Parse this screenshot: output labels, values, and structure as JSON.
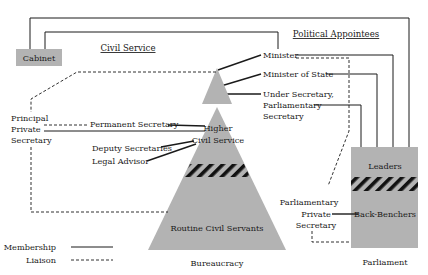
{
  "colors": {
    "shape_fill": "#b3b3b3",
    "line": "#1a1a1a",
    "background": "#ffffff"
  },
  "sections": {
    "civil_service": "Civil Service",
    "political_appointees": "Political Appointees"
  },
  "nodes": {
    "cabinet": "Cabinet",
    "minister": "Minister",
    "minister_of_state": "Minister of State",
    "under_secretary_1": "Under Secretary,",
    "under_secretary_2": "Parliamentary",
    "under_secretary_3": "Secretary",
    "principal_private_secretary_1": "Principal",
    "principal_private_secretary_2": "Private",
    "principal_private_secretary_3": "Secretary",
    "permanent_secretary": "Permanent Secretary",
    "higher_civil_service_1": "Higher",
    "higher_civil_service_2": "Civil Service",
    "deputy_secretaries": "Deputy Secretaries",
    "legal_advisor": "Legal Advisor",
    "routine_civil_servants": "Routine Civil Servants",
    "bureaucracy": "Bureaucracy",
    "leaders": "Leaders",
    "back_benchers": "Back-Benchers",
    "parliamentary_private_secretary_1": "Parliamentary",
    "parliamentary_private_secretary_2": "Private",
    "parliamentary_private_secretary_3": "Secretary",
    "parliament": "Parliament"
  },
  "legend": {
    "membership": "Membership",
    "liaison": "Liaison"
  }
}
